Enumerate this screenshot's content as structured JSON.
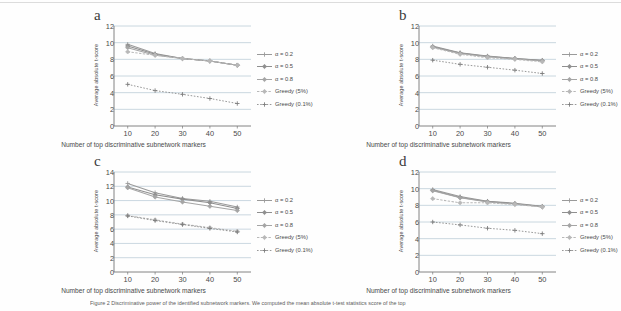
{
  "figure": {
    "caption": "Figure 2 Discriminative power of the identified subnetwork markers. We computed the mean absolute t-test statistics score of the top",
    "axis_titles": {
      "x": "Number of top discriminative subnetwork markers",
      "y": "Average absolute t-score"
    },
    "legend_labels": [
      "α = 0.2",
      "α = 0.5",
      "α = 0.8",
      "Greedy (5%)",
      "Greedy (0.1%)"
    ],
    "series_colors": [
      "#9a9a9a",
      "#8f8f8f",
      "#a5a5a5",
      "#b8b8b8",
      "#7d7d7d"
    ]
  },
  "chart_data": [
    {
      "type": "line",
      "panel": "a",
      "title": "",
      "xlabel": "Number of top discriminative subnetwork markers",
      "ylabel": "Average absolute t-score",
      "x": [
        10,
        20,
        30,
        40,
        50
      ],
      "xticks": [
        10,
        20,
        30,
        40,
        50
      ],
      "yticks": [
        0,
        2,
        4,
        6,
        8,
        10,
        12
      ],
      "ylim": [
        0,
        12
      ],
      "xlim": [
        5,
        55
      ],
      "grid": "horizontal",
      "legend_position": "right",
      "series": [
        {
          "name": "α = 0.2",
          "values": [
            9.8,
            8.7,
            8.1,
            7.8,
            7.3
          ]
        },
        {
          "name": "α = 0.5",
          "values": [
            9.6,
            8.6,
            8.1,
            7.8,
            7.3
          ]
        },
        {
          "name": "α = 0.8",
          "values": [
            9.4,
            8.5,
            8.1,
            7.8,
            7.3
          ]
        },
        {
          "name": "Greedy (5%)",
          "values": [
            8.9,
            8.5,
            8.1,
            7.8,
            7.3
          ]
        },
        {
          "name": "Greedy (0.1%)",
          "values": [
            5.0,
            4.25,
            3.8,
            3.3,
            2.7
          ]
        }
      ]
    },
    {
      "type": "line",
      "panel": "b",
      "title": "",
      "xlabel": "Number of top discriminative subnetwork markers",
      "ylabel": "Average absolute t-score",
      "x": [
        10,
        20,
        30,
        40,
        50
      ],
      "xticks": [
        10,
        20,
        30,
        40,
        50
      ],
      "yticks": [
        0,
        2,
        4,
        6,
        8,
        10,
        12
      ],
      "ylim": [
        0,
        12
      ],
      "xlim": [
        5,
        55
      ],
      "grid": "horizontal",
      "legend_position": "right",
      "series": [
        {
          "name": "α = 0.2",
          "values": [
            9.6,
            8.8,
            8.4,
            8.1,
            7.9
          ]
        },
        {
          "name": "α = 0.5",
          "values": [
            9.5,
            8.75,
            8.35,
            8.1,
            7.85
          ]
        },
        {
          "name": "α = 0.8",
          "values": [
            9.45,
            8.7,
            8.3,
            8.05,
            7.8
          ]
        },
        {
          "name": "Greedy (5%)",
          "values": [
            9.4,
            8.6,
            8.2,
            8.0,
            7.7
          ]
        },
        {
          "name": "Greedy (0.1%)",
          "values": [
            7.9,
            7.4,
            7.05,
            6.7,
            6.3
          ]
        }
      ]
    },
    {
      "type": "line",
      "panel": "c",
      "title": "",
      "xlabel": "Number of top discriminative subnetwork markers",
      "ylabel": "Average absolute t-score",
      "x": [
        10,
        20,
        30,
        40,
        50
      ],
      "xticks": [
        10,
        20,
        30,
        40,
        50
      ],
      "yticks": [
        0,
        2,
        4,
        6,
        8,
        10,
        12,
        14
      ],
      "ylim": [
        0,
        14
      ],
      "xlim": [
        5,
        55
      ],
      "grid": "horizontal",
      "legend_position": "right",
      "series": [
        {
          "name": "α = 0.2",
          "values": [
            12.4,
            11.1,
            10.3,
            9.9,
            9.1
          ]
        },
        {
          "name": "α = 0.5",
          "values": [
            11.9,
            10.8,
            10.2,
            9.7,
            8.9
          ]
        },
        {
          "name": "α = 0.8",
          "values": [
            11.8,
            10.5,
            9.8,
            9.2,
            8.6
          ]
        },
        {
          "name": "Greedy (5%)",
          "values": [
            7.9,
            7.3,
            6.7,
            6.2,
            5.7
          ]
        },
        {
          "name": "Greedy (0.1%)",
          "values": [
            7.85,
            7.2,
            6.65,
            6.1,
            5.6
          ]
        }
      ]
    },
    {
      "type": "line",
      "panel": "d",
      "title": "",
      "xlabel": "Number of top discriminative subnetwork markers",
      "ylabel": "Average absolute t-score",
      "x": [
        10,
        20,
        30,
        40,
        50
      ],
      "xticks": [
        10,
        20,
        30,
        40,
        50
      ],
      "yticks": [
        0,
        2,
        4,
        6,
        8,
        10,
        12
      ],
      "ylim": [
        0,
        12
      ],
      "xlim": [
        5,
        55
      ],
      "grid": "horizontal",
      "legend_position": "right",
      "series": [
        {
          "name": "α = 0.2",
          "values": [
            9.9,
            9.05,
            8.5,
            8.25,
            7.9
          ]
        },
        {
          "name": "α = 0.5",
          "values": [
            9.8,
            8.95,
            8.45,
            8.2,
            7.85
          ]
        },
        {
          "name": "α = 0.8",
          "values": [
            9.75,
            8.9,
            8.4,
            8.15,
            7.8
          ]
        },
        {
          "name": "Greedy (5%)",
          "values": [
            8.8,
            8.3,
            8.3,
            8.1,
            7.8
          ]
        },
        {
          "name": "Greedy (0.1%)",
          "values": [
            6.0,
            5.65,
            5.25,
            5.0,
            4.6
          ]
        }
      ]
    }
  ],
  "panels": {
    "a": {
      "letter": "a"
    },
    "b": {
      "letter": "b"
    },
    "c": {
      "letter": "c"
    },
    "d": {
      "letter": "d"
    }
  }
}
